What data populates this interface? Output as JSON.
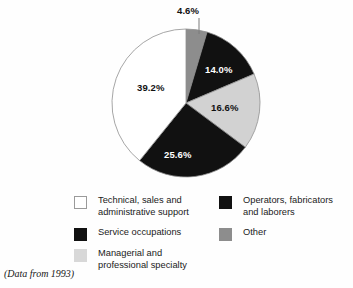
{
  "chart_data": {
    "type": "pie",
    "title": "",
    "caption": "(Data from 1993)",
    "start_angle_deg": 0,
    "direction": "clockwise",
    "total": 100.0,
    "units": "percent",
    "legend_position": "bottom",
    "grid": false,
    "categories": [
      "Technical, sales and administrative support",
      "Service occupations",
      "Managerial and professional specialty",
      "Operators, fabricators and laborers",
      "Other"
    ],
    "values": [
      39.2,
      25.6,
      16.6,
      14.0,
      4.6
    ],
    "colors": [
      "#ffffff",
      "#111111",
      "#d2d2d2",
      "#111111",
      "#8d8d8d"
    ],
    "slices": [
      {
        "label": "Other",
        "value": 4.6,
        "display": "4.6%",
        "color": "#8d8d8d",
        "text_color": "dark",
        "leader_line": true
      },
      {
        "label": "Operators",
        "value": 14.0,
        "display": "14.0%",
        "color": "#111111",
        "text_color": "light",
        "leader_line": false
      },
      {
        "label": "Managerial",
        "value": 16.6,
        "display": "16.6%",
        "color": "#d2d2d2",
        "text_color": "dark",
        "leader_line": false
      },
      {
        "label": "Service",
        "value": 25.6,
        "display": "25.6%",
        "color": "#111111",
        "text_color": "light",
        "leader_line": false
      },
      {
        "label": "Technical",
        "value": 39.2,
        "display": "39.2%",
        "color": "#ffffff",
        "text_color": "dark",
        "leader_line": false
      }
    ]
  },
  "pie": {
    "labels": {
      "other": "4.6%",
      "operators": "14.0%",
      "managerial": "16.6%",
      "service": "25.6%",
      "technical": "39.2%"
    }
  },
  "legend": {
    "items": [
      {
        "label": "Technical, sales and\nadministrative support",
        "swatch": "#ffffff",
        "border": "#9a9a9a"
      },
      {
        "label": "Service occupations",
        "swatch": "#111111",
        "border": "#111111"
      },
      {
        "label": "Managerial and\nprofessional specialty",
        "swatch": "#d8d8d8",
        "border": "#d8d8d8"
      },
      {
        "label": "Operators, fabricators\nand laborers",
        "swatch": "#111111",
        "border": "#111111"
      },
      {
        "label": "Other",
        "swatch": "#8d8d8d",
        "border": "#8d8d8d"
      }
    ]
  },
  "caption": {
    "text": "(Data from 1993)"
  }
}
